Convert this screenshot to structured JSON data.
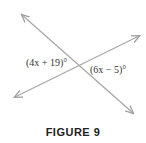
{
  "figure": {
    "caption": "FIGURE 9",
    "line_color": "#a0a0a0",
    "angles": [
      {
        "label": "(4x + 19)°",
        "position": "left of intersection"
      },
      {
        "label": "(6x − 5)°",
        "position": "right of intersection"
      }
    ],
    "lines": [
      {
        "name": "line-1",
        "from": [
          22,
          15
        ],
        "to": [
          133,
          113
        ]
      },
      {
        "name": "line-2",
        "from": [
          15,
          97
        ],
        "to": [
          139,
          36
        ]
      }
    ]
  }
}
